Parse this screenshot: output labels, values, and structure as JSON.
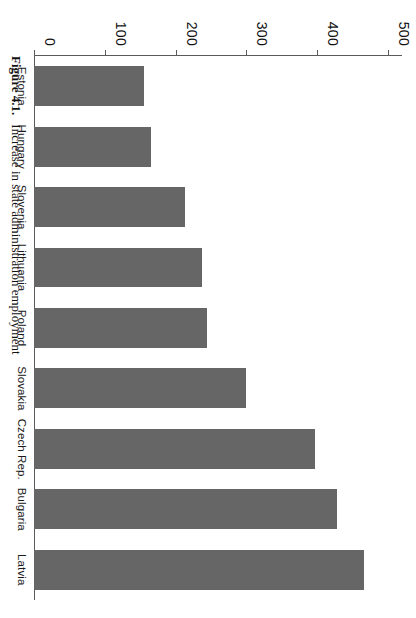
{
  "figure": {
    "caption_number": "Figure 4.1.",
    "caption_text": "Increase in state administration employment",
    "bar_color": "#666666",
    "axis_color": "#5a5a5a",
    "background": "#ffffff"
  },
  "chart_data": {
    "type": "bar",
    "orientation": "horizontal",
    "title": "Increase in state administration employment",
    "xlabel": "",
    "ylabel": "",
    "categories": [
      "Estonia",
      "Hungary",
      "Slovenia",
      "Lithuania",
      "Poland",
      "Slovakia",
      "Czech Rep.",
      "Bulgaria",
      "Latvia"
    ],
    "values": [
      156,
      166,
      213,
      238,
      244,
      300,
      397,
      428,
      467
    ],
    "ylim": [
      0,
      520
    ],
    "ticks": [
      0,
      100,
      200,
      300,
      400,
      500
    ],
    "tick_labels": [
      "0",
      "100",
      "200",
      "300",
      "400",
      "500"
    ],
    "grid": false,
    "legend": null,
    "series": [
      {
        "name": "Increase in state administration employment",
        "values": [
          156,
          166,
          213,
          238,
          244,
          300,
          397,
          428,
          467
        ]
      }
    ]
  }
}
